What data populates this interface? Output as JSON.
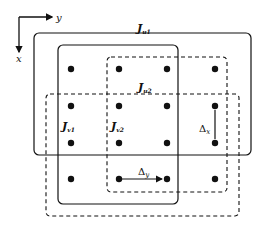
{
  "axes": {
    "horizontal_label": "y",
    "vertical_label": "x"
  },
  "regions": [
    {
      "name": "J_u1",
      "symbol": "J",
      "subscript": "u1",
      "style": "solid"
    },
    {
      "name": "J_u2",
      "symbol": "J",
      "subscript": "u2",
      "style": "dashed"
    },
    {
      "name": "J_v1",
      "symbol": "J",
      "subscript": "v1",
      "style": "solid"
    },
    {
      "name": "J_v2",
      "symbol": "J",
      "subscript": "v2",
      "style": "dashed"
    }
  ],
  "grid": {
    "columns": 4,
    "rows": 4,
    "point_count": 16
  },
  "spacings": {
    "delta_x": {
      "symbol": "Δ",
      "subscript": "x"
    },
    "delta_y": {
      "symbol": "Δ",
      "subscript": "y"
    }
  },
  "colors": {
    "stroke": "#111111",
    "background": "#ffffff"
  }
}
